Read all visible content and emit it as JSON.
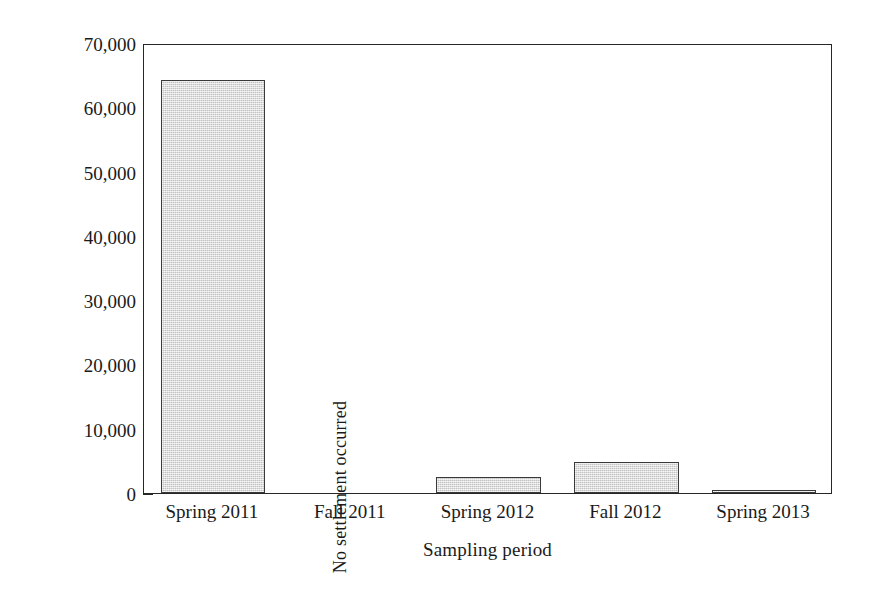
{
  "chart_data": {
    "type": "bar",
    "title": "",
    "subtitle": "",
    "xlabel": "Sampling period",
    "ylabel": "Settled juveniles m⁻²",
    "ylabel_parts": {
      "text": "Settled juveniles m",
      "exponent": "−2"
    },
    "categories": [
      "Spring 2011",
      "Fall 2011",
      "Spring 2012",
      "Fall 2012",
      "Spring 2013"
    ],
    "values": [
      64200,
      0,
      2500,
      4800,
      400
    ],
    "ylim": [
      0,
      70000
    ],
    "ytick_values": [
      0,
      10000,
      20000,
      30000,
      40000,
      50000,
      60000,
      70000
    ],
    "ytick_labels": [
      "0",
      "10,000",
      "20,000",
      "30,000",
      "40,000",
      "50,000",
      "60,000",
      "70,000"
    ],
    "xtick_labels": [
      "Spring 2011",
      "Fall 2011",
      "Spring 2012",
      "Fall 2012",
      "Spring 2013"
    ],
    "grid": false,
    "legend": null,
    "legend_position": "none",
    "annotations": [
      {
        "category": "Fall 2011",
        "text": "No settlement occurred",
        "rotation": -90
      }
    ],
    "bar_fill_color": "#d6d6d6",
    "bar_edge_color": "#3a3a3a",
    "axis_color": "#262626",
    "background_color": "#ffffff",
    "text_color": "#1a1a1a",
    "bars": [
      {
        "label": "Spring 2011",
        "value": 64200,
        "annotation": ""
      },
      {
        "label": "Fall 2011",
        "value": 0,
        "annotation": "No settlement occurred"
      },
      {
        "label": "Spring 2012",
        "value": 2500,
        "annotation": ""
      },
      {
        "label": "Fall 2012",
        "value": 4800,
        "annotation": ""
      },
      {
        "label": "Spring 2013",
        "value": 400,
        "annotation": ""
      }
    ]
  }
}
